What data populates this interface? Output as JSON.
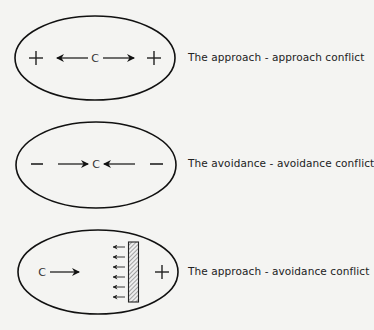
{
  "panels": [
    {
      "id": "approach-approach",
      "caption": "The approach - approach conflict",
      "left_valence": "+",
      "right_valence": "+",
      "center_label": "C",
      "arrows": "outward"
    },
    {
      "id": "avoidance-avoidance",
      "caption": "The avoidance - avoidance conflict",
      "left_valence": "−",
      "right_valence": "−",
      "center_label": "C",
      "arrows": "inward"
    },
    {
      "id": "approach-avoidance",
      "caption": "The approach - avoidance conflict",
      "left_label": "C",
      "right_valence": "+",
      "barrier": "hatched barrier with repelling arrows",
      "arrows": "toward barrier"
    }
  ],
  "colors": {
    "background": "#f4f4f2",
    "stroke": "#111111",
    "text": "#222222"
  }
}
